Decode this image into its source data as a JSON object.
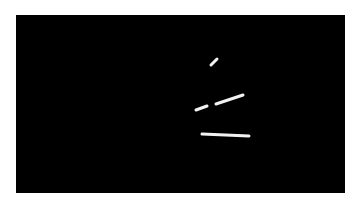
{
  "image": {
    "background_color": "#000000",
    "margin_color": "#ffffff",
    "frame": {
      "x": 16,
      "y": 15,
      "width": 329,
      "height": 178
    },
    "stroke_color": "#f2f2f2",
    "segments": [
      {
        "name": "short-diagonal",
        "x1": 211,
        "y1": 65,
        "x2": 217,
        "y2": 59,
        "width": 3
      },
      {
        "name": "short-dash",
        "x1": 196,
        "y1": 110,
        "x2": 207,
        "y2": 106,
        "width": 3
      },
      {
        "name": "long-diagonal",
        "x1": 216,
        "y1": 104,
        "x2": 243,
        "y2": 95,
        "width": 3
      },
      {
        "name": "horizontal-bar",
        "x1": 202,
        "y1": 134,
        "x2": 249,
        "y2": 136,
        "width": 3
      }
    ]
  }
}
